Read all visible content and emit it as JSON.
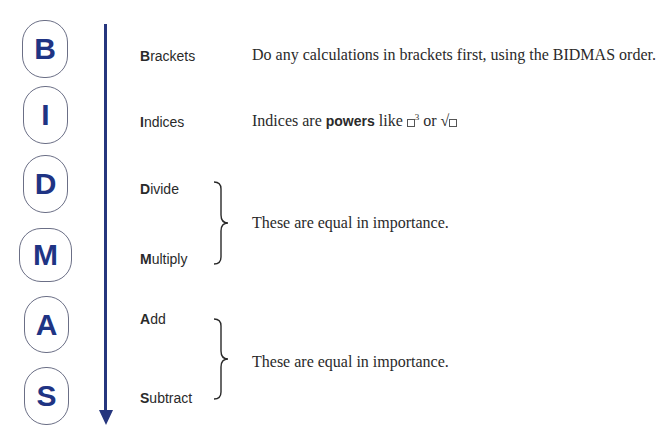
{
  "badges": [
    {
      "letter": "B"
    },
    {
      "letter": "I"
    },
    {
      "letter": "D"
    },
    {
      "letter": "M"
    },
    {
      "letter": "A"
    },
    {
      "letter": "S"
    }
  ],
  "terms": [
    {
      "initial": "B",
      "rest": "rackets"
    },
    {
      "initial": "I",
      "rest": "ndices"
    },
    {
      "initial": "D",
      "rest": "ivide"
    },
    {
      "initial": "M",
      "rest": "ultiply"
    },
    {
      "initial": "A",
      "rest": "dd"
    },
    {
      "initial": "S",
      "rest": "ubtract"
    }
  ],
  "descriptions": {
    "brackets": "Do any calculations in brackets first, using the BIDMAS order.",
    "indices_prefix": "Indices are ",
    "indices_bold": "powers",
    "indices_like": " like ",
    "indices_power": "3",
    "indices_or": " or ",
    "divide_multiply": "These are equal in importance.",
    "add_subtract": "These are equal in importance."
  },
  "colors": {
    "accent": "#1f3484",
    "arrow": "#26367e",
    "badge_border": "#6b6f86",
    "text": "#2a2a2a"
  }
}
